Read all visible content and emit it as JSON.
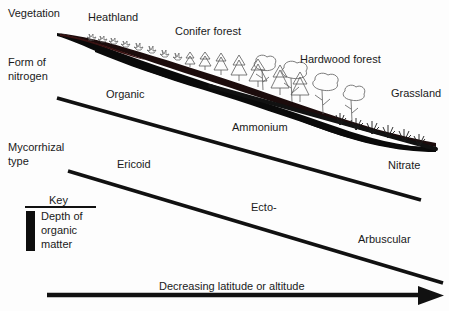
{
  "diagram": {
    "title_implicit": "Vegetation, nitrogen form and mycorrhizal type along a latitude/altitude gradient",
    "row_labels": [
      {
        "id": "vegetation",
        "text": "Vegetation",
        "x": 8,
        "y": 8
      },
      {
        "id": "form-of-nitrogen",
        "line1": "Form of",
        "line2": "nitrogen",
        "x": 8,
        "y": 58
      },
      {
        "id": "mycorrhizal-type",
        "line1": "Mycorrhizal",
        "line2": "type",
        "x": 8,
        "y": 143
      }
    ],
    "vegetation_labels": [
      {
        "id": "heathland",
        "text": "Heathland",
        "x": 88,
        "y": 12
      },
      {
        "id": "conifer-forest",
        "text": "Conifer forest",
        "x": 175,
        "y": 26
      },
      {
        "id": "hardwood-forest",
        "text": "Hardwood forest",
        "x": 300,
        "y": 55
      },
      {
        "id": "grassland",
        "text": "Grassland",
        "x": 391,
        "y": 88
      }
    ],
    "nitrogen_labels": [
      {
        "id": "organic",
        "text": "Organic",
        "x": 106,
        "y": 89
      },
      {
        "id": "ammonium",
        "text": "Ammonium",
        "x": 232,
        "y": 122
      },
      {
        "id": "nitrate",
        "text": "Nitrate",
        "x": 388,
        "y": 160
      }
    ],
    "mycorrhizal_labels": [
      {
        "id": "ericoid",
        "text": "Ericoid",
        "x": 117,
        "y": 159
      },
      {
        "id": "ecto",
        "text": "Ecto-",
        "x": 251,
        "y": 202
      },
      {
        "id": "arbuscular",
        "text": "Arbuscular",
        "x": 358,
        "y": 234
      }
    ],
    "axis": {
      "id": "gradient-arrow",
      "label": "Decreasing latitude or altitude",
      "label_x": 159,
      "label_y": 281
    },
    "key": {
      "title": "Key",
      "swatch_label_lines": [
        "Depth of",
        "organic",
        "matter"
      ],
      "x": 24,
      "y": 193,
      "width": 72
    },
    "colors": {
      "ink": "#111111",
      "organic_wedge": "#0a0a0a",
      "organic_wedge_tint": "#3a1212",
      "plant_outline": "#555555",
      "background": "#fdfdfd"
    }
  }
}
